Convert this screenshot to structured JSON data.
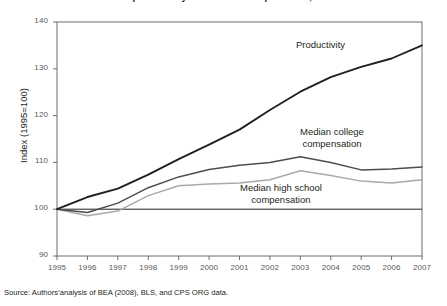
{
  "figure": {
    "title": "Growth of productivity and median compensation, 1995–2007",
    "source_note": "Source: Authors’analysis of BEA (2008), BLS, and CPS ORG data.",
    "ylabel": "Index (1995=100)",
    "colors": {
      "productivity": "#231f20",
      "college": "#4d4d4f",
      "highschool": "#a7a9ac",
      "axis": "#6d6e71",
      "reference": "#231f20"
    }
  },
  "labels": {
    "productivity": "Productivity",
    "college_line1": "Median college",
    "college_line2": "compensation",
    "highschool_line1": "Median high school",
    "highschool_line2": "compensation"
  },
  "chart_data": {
    "type": "line",
    "title": "Growth of productivity and median compensation, 1995–2007",
    "xlabel": "",
    "ylabel": "Index (1995=100)",
    "x": [
      1995,
      1996,
      1997,
      1998,
      1999,
      2000,
      2001,
      2002,
      2003,
      2004,
      2005,
      2006,
      2007
    ],
    "xlim": [
      1995,
      2007
    ],
    "ylim": [
      90,
      140
    ],
    "yticks": [
      90,
      100,
      110,
      120,
      130,
      140
    ],
    "xticks": [
      "1995",
      "1996",
      "1997",
      "1998",
      "1999",
      "2000",
      "2001",
      "2002",
      "2003",
      "2004",
      "2005",
      "2006",
      "2007"
    ],
    "grid": false,
    "legend": "inline-annotations",
    "reference_line": 100,
    "series": [
      {
        "name": "Productivity",
        "color": "#231f20",
        "values": [
          100.0,
          102.6,
          104.4,
          107.4,
          110.7,
          113.8,
          117.0,
          121.2,
          125.1,
          128.2,
          130.4,
          132.2,
          135.0
        ]
      },
      {
        "name": "Median college compensation",
        "color": "#4d4d4f",
        "values": [
          100.0,
          99.3,
          101.3,
          104.6,
          106.9,
          108.5,
          109.4,
          110.0,
          111.2,
          110.0,
          108.4,
          108.6,
          109.0
        ]
      },
      {
        "name": "Median high school compensation",
        "color": "#a7a9ac",
        "values": [
          100.0,
          98.6,
          99.6,
          102.9,
          105.0,
          105.4,
          105.6,
          106.3,
          108.2,
          107.2,
          106.0,
          105.6,
          106.3
        ]
      }
    ]
  }
}
